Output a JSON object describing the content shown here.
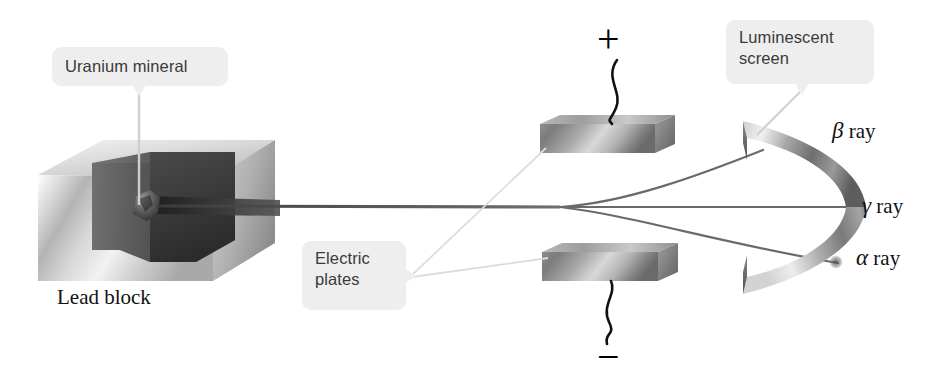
{
  "figure": {
    "background_color": "#ffffff"
  },
  "callouts": [
    {
      "id": "uranium-mineral",
      "label": "Uranium mineral",
      "box_color": "#eeeeee",
      "text_color": "#3a3a3a"
    },
    {
      "id": "luminescent-screen",
      "label": "Luminescent\nscreen",
      "box_color": "#eeeeee",
      "text_color": "#3a3a3a"
    },
    {
      "id": "electric-plates",
      "label": "Electric\nplates",
      "box_color": "#eeeeee",
      "text_color": "#3a3a3a"
    }
  ],
  "labels": {
    "lead_block": "Lead block",
    "beta_ray": {
      "greek": "β",
      "text": " ray"
    },
    "gamma_ray": {
      "greek": "γ",
      "text": " ray"
    },
    "alpha_ray": {
      "greek": "α",
      "text": "  ray"
    }
  },
  "polarity": {
    "top_plate_sign": "+",
    "bottom_plate_sign": "−"
  },
  "components": {
    "lead_block": {
      "name": "lead-block",
      "description": "grey cut-away lead cube containing the sample cavity"
    },
    "sample": {
      "name": "uranium-mineral-sample",
      "description": "dark mineral chunk inside the cavity"
    },
    "top_plate": {
      "name": "electric-plate-positive",
      "charge": "+"
    },
    "bottom_plate": {
      "name": "electric-plate-negative",
      "charge": "−"
    },
    "screen": {
      "name": "luminescent-screen",
      "description": "curved metallic detection screen"
    }
  },
  "rays": [
    {
      "name": "beta",
      "symbol": "β",
      "deflection": "up toward positive plate"
    },
    {
      "name": "gamma",
      "symbol": "γ",
      "deflection": "undeflected, straight"
    },
    {
      "name": "alpha",
      "symbol": "α",
      "deflection": "down toward negative plate"
    }
  ]
}
